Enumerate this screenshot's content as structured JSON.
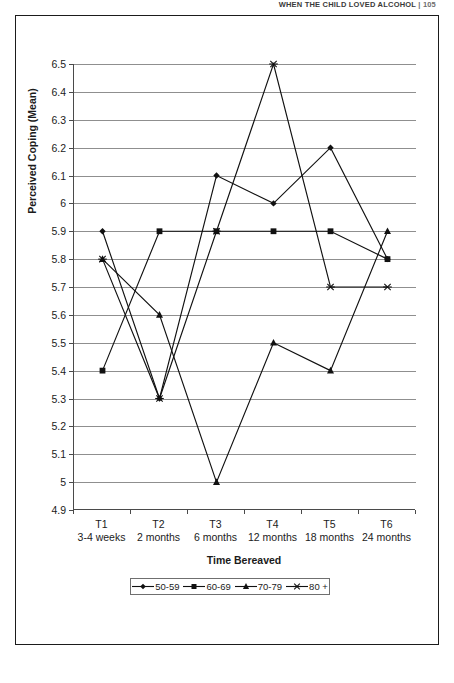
{
  "page_header": {
    "running_title": "WHEN THE CHILD LOVED ALCOHOL",
    "separator": "|",
    "page_number": "105"
  },
  "chart_data": {
    "type": "line",
    "title": "",
    "xlabel": "Time Bereaved",
    "ylabel": "Perceived Coping (Mean)",
    "ylim": [
      4.9,
      6.5
    ],
    "ytick_step": 0.1,
    "grid": true,
    "legend_position": "bottom",
    "categories": [
      "T1",
      "T2",
      "T3",
      "T4",
      "T5",
      "T6"
    ],
    "category_sublabels": [
      "3-4 weeks",
      "2 months",
      "6 months",
      "12 months",
      "18 months",
      "24 months"
    ],
    "ytick_labels": [
      "6.5",
      "6.4",
      "6.3",
      "6.2",
      "6.1",
      "6",
      "5.9",
      "5.8",
      "5.7",
      "5.6",
      "5.5",
      "5.4",
      "5.3",
      "5.2",
      "5.1",
      "5",
      "4.9"
    ],
    "series": [
      {
        "name": "50-59",
        "marker": "diamond",
        "values": [
          5.9,
          5.3,
          6.1,
          6.0,
          6.2,
          5.8
        ]
      },
      {
        "name": "60-69",
        "marker": "square",
        "values": [
          5.4,
          5.9,
          5.9,
          5.9,
          5.9,
          5.8
        ]
      },
      {
        "name": "70-79",
        "marker": "triangle",
        "values": [
          5.8,
          5.6,
          5.0,
          5.5,
          5.4,
          5.9
        ]
      },
      {
        "name": "80 +",
        "marker": "star",
        "values": [
          5.8,
          5.3,
          5.9,
          6.5,
          5.7,
          5.7
        ]
      }
    ],
    "line_color": "#111111",
    "grid_color": "#8f8f8f",
    "axis_color": "#4a4a4a"
  },
  "legend": {
    "items": [
      {
        "label": "50-59",
        "marker": "diamond"
      },
      {
        "label": "60-69",
        "marker": "square"
      },
      {
        "label": "70-79",
        "marker": "triangle"
      },
      {
        "label": "80 +",
        "marker": "star"
      }
    ]
  }
}
